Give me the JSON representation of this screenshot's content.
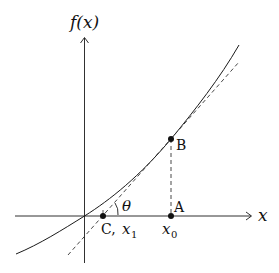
{
  "diagram": {
    "axes": {
      "y_label": "f(x)",
      "x_label": "x"
    },
    "points": {
      "A": {
        "label": "A"
      },
      "B": {
        "label": "B"
      },
      "C": {
        "label": "C, x₁",
        "name_text": "C,",
        "var_text": "x",
        "sub_text": "1"
      }
    },
    "x0": {
      "var_text": "x",
      "sub_text": "0"
    },
    "angle_label": "θ",
    "colors": {
      "stroke": "#1a1a1a",
      "dashed": "#333333",
      "background": "#ffffff"
    }
  }
}
